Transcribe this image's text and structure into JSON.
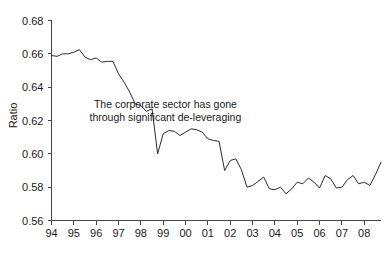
{
  "chart_data": {
    "type": "line",
    "title": "",
    "xlabel": "",
    "ylabel": "Ratio",
    "ylim": [
      0.56,
      0.68
    ],
    "xlim": [
      1994,
      2008.75
    ],
    "ytick_labels": [
      "0.68",
      "0.66",
      "0.64",
      "0.62",
      "0.60",
      "0.58",
      "0.56"
    ],
    "ytick_values": [
      0.68,
      0.66,
      0.64,
      0.62,
      0.6,
      0.58,
      0.56
    ],
    "xtick_labels": [
      "94",
      "95",
      "96",
      "97",
      "98",
      "99",
      "00",
      "01",
      "02",
      "03",
      "04",
      "05",
      "06",
      "07",
      "08"
    ],
    "xtick_values": [
      1994,
      1995,
      1996,
      1997,
      1998,
      1999,
      2000,
      2001,
      2002,
      2003,
      2004,
      2005,
      2006,
      2007,
      2008
    ],
    "grid": false,
    "legend": "none",
    "line_color": "#2b2b2b",
    "annotations": [
      {
        "name": "deleveraging-note",
        "line1": "The corporate sector has gone",
        "line2": "through significant de-leveraging",
        "x": 1999.1,
        "y": 0.6275
      }
    ],
    "series": [
      {
        "name": "Ratio",
        "x": [
          1994.0,
          1994.25,
          1994.5,
          1994.75,
          1995.0,
          1995.25,
          1995.5,
          1995.75,
          1996.0,
          1996.25,
          1996.5,
          1996.75,
          1997.0,
          1997.25,
          1997.5,
          1997.75,
          1998.0,
          1998.25,
          1998.5,
          1998.75,
          1999.0,
          1999.25,
          1999.5,
          1999.75,
          2000.0,
          2000.25,
          2000.5,
          2000.75,
          2001.0,
          2001.25,
          2001.5,
          2001.75,
          2002.0,
          2002.25,
          2002.5,
          2002.75,
          2003.0,
          2003.25,
          2003.5,
          2003.75,
          2004.0,
          2004.25,
          2004.5,
          2004.75,
          2005.0,
          2005.25,
          2005.5,
          2005.75,
          2006.0,
          2006.25,
          2006.5,
          2006.75,
          2007.0,
          2007.25,
          2007.5,
          2007.75,
          2008.0,
          2008.25,
          2008.5,
          2008.75
        ],
        "values": [
          0.659,
          0.6585,
          0.66,
          0.66,
          0.661,
          0.6625,
          0.658,
          0.6565,
          0.6575,
          0.655,
          0.6555,
          0.6555,
          0.648,
          0.643,
          0.637,
          0.63,
          0.629,
          0.6255,
          0.627,
          0.6,
          0.612,
          0.614,
          0.6135,
          0.611,
          0.613,
          0.615,
          0.6145,
          0.613,
          0.609,
          0.608,
          0.6075,
          0.59,
          0.596,
          0.597,
          0.5905,
          0.58,
          0.581,
          0.5835,
          0.586,
          0.579,
          0.5785,
          0.58,
          0.576,
          0.579,
          0.583,
          0.582,
          0.5855,
          0.583,
          0.5795,
          0.587,
          0.585,
          0.5795,
          0.58,
          0.5845,
          0.587,
          0.582,
          0.583,
          0.581,
          0.5875,
          0.595
        ]
      }
    ]
  }
}
